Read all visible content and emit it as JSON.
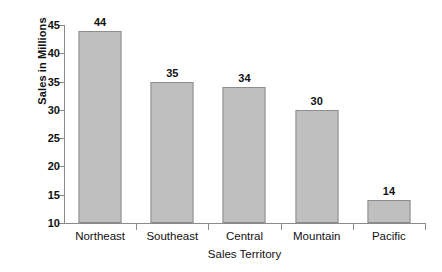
{
  "chart_data": {
    "type": "bar",
    "title": "",
    "subtitle": "",
    "xlabel": "Sales Territory",
    "ylabel": "Sales in Millions",
    "categories": [
      "Northeast",
      "Southeast",
      "Central",
      "Mountain",
      "Pacific"
    ],
    "values": [
      44,
      35,
      34,
      30,
      14
    ],
    "data_labels": [
      "44",
      "35",
      "34",
      "30",
      "14"
    ],
    "ylim": [
      10,
      45
    ],
    "ytick_values": [
      10,
      15,
      20,
      25,
      30,
      35,
      40,
      45
    ],
    "ytick_labels": [
      "10",
      "15",
      "20",
      "25",
      "30",
      "35",
      "40",
      "45"
    ],
    "grid": false,
    "legend": false,
    "legend_position": "none",
    "bar_fill_color": "#bfbfbf",
    "bar_border_color": "#8d8d8d",
    "axis_color": "#8a8a8a",
    "text_color": "#111111",
    "background_color": "#ffffff"
  },
  "axes": {
    "y_title": "Sales in Millions",
    "x_title": "Sales Territory"
  },
  "y_ticks": [
    {
      "label": "45",
      "value": 45
    },
    {
      "label": "40",
      "value": 40
    },
    {
      "label": "35",
      "value": 35
    },
    {
      "label": "30",
      "value": 30
    },
    {
      "label": "25",
      "value": 25
    },
    {
      "label": "20",
      "value": 20
    },
    {
      "label": "15",
      "value": 15
    },
    {
      "label": "10",
      "value": 10
    }
  ],
  "bars": [
    {
      "category": "Northeast",
      "value": 44,
      "label": "44"
    },
    {
      "category": "Southeast",
      "value": 35,
      "label": "35"
    },
    {
      "category": "Central",
      "value": 34,
      "label": "34"
    },
    {
      "category": "Mountain",
      "value": 30,
      "label": "30"
    },
    {
      "category": "Pacific",
      "value": 14,
      "label": "14"
    }
  ]
}
